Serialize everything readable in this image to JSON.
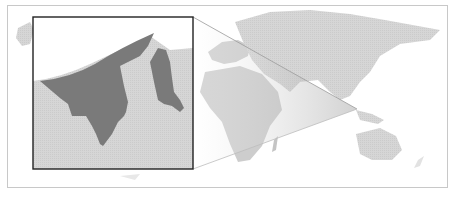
{
  "map": {
    "subject": "Brunei",
    "type": "locator-map",
    "inset": {
      "label": "Brunei inset",
      "highlight_color": "#7a7a7a",
      "land_color": "#cfcfcf",
      "sea_color": "#ffffff",
      "border_color": "#222222"
    },
    "world": {
      "land_color": "#dcdcdc",
      "shaded_land_color": "#b8b8b8",
      "frame_color": "#c8c8c8"
    },
    "callout_point": {
      "x": 357,
      "y": 109
    }
  }
}
